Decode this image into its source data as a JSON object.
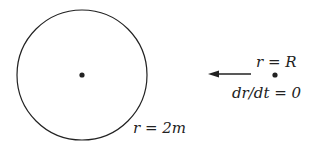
{
  "diagram": {
    "horizon": {
      "cx": 82,
      "cy": 75,
      "r": 65,
      "label": "r = 2m"
    },
    "center_point": {
      "cx": 82,
      "cy": 75
    },
    "particle": {
      "cx": 275,
      "cy": 75
    },
    "arrow": {
      "x1": 251,
      "y1": 74,
      "x2": 208,
      "y2": 74,
      "direction": "toward-center"
    },
    "labels": {
      "particle_position": "r = R",
      "particle_velocity": "dr/dt = 0",
      "horizon_radius": "r = 2m"
    },
    "colors": {
      "stroke": "#222222",
      "background": "#ffffff"
    }
  }
}
